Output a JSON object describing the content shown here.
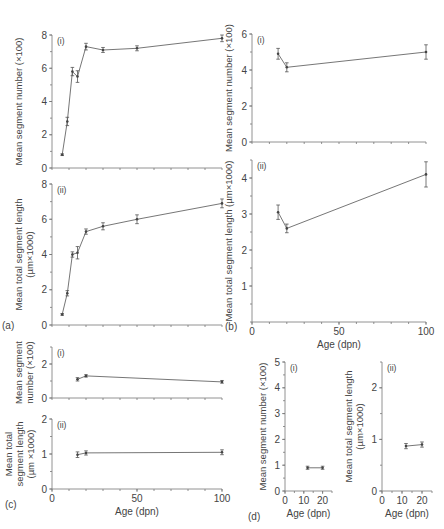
{
  "figure": {
    "panel_labels": [
      "(a)",
      "(b)",
      "(c)",
      "(d)"
    ]
  },
  "chart_data": [
    {
      "id": "a-i",
      "panel": "(a)",
      "subpanel": "(i)",
      "type": "line",
      "title": "",
      "xlabel": "",
      "ylabel": "Mean segment number (×100)",
      "xlim": [
        0,
        100
      ],
      "ylim": [
        0,
        8
      ],
      "yticks": [
        0,
        2,
        4,
        6,
        8
      ],
      "xticks_labeled": false,
      "grid": false,
      "x": [
        6,
        9,
        12,
        15,
        20,
        30,
        50,
        100
      ],
      "values": [
        0.8,
        2.8,
        5.8,
        5.5,
        7.3,
        7.1,
        7.2,
        7.8
      ],
      "errors": [
        0.05,
        0.25,
        0.25,
        0.35,
        0.2,
        0.15,
        0.15,
        0.2
      ]
    },
    {
      "id": "a-ii",
      "panel": "(a)",
      "subpanel": "(ii)",
      "type": "line",
      "title": "",
      "xlabel": "",
      "ylabel": "Mean total segment length (µm×1000)",
      "xlim": [
        0,
        100
      ],
      "ylim": [
        0,
        8
      ],
      "yticks": [
        0,
        2,
        4,
        6,
        8
      ],
      "xticks_labeled": false,
      "grid": false,
      "x": [
        6,
        9,
        12,
        15,
        20,
        30,
        50,
        100
      ],
      "values": [
        0.6,
        1.8,
        4.0,
        4.1,
        5.3,
        5.6,
        6.0,
        6.9
      ],
      "errors": [
        0.05,
        0.15,
        0.15,
        0.35,
        0.15,
        0.2,
        0.25,
        0.25
      ]
    },
    {
      "id": "b-i",
      "panel": "(b)",
      "subpanel": "(i)",
      "type": "line",
      "title": "",
      "xlabel": "",
      "ylabel": "Mean segment number (×100)",
      "xlim": [
        0,
        100
      ],
      "ylim": [
        0,
        6
      ],
      "yticks": [
        0,
        2,
        4,
        6
      ],
      "xticks_labeled": false,
      "grid": false,
      "x": [
        15,
        20,
        100
      ],
      "values": [
        4.9,
        4.15,
        5.0
      ],
      "errors": [
        0.3,
        0.25,
        0.4
      ]
    },
    {
      "id": "b-ii",
      "panel": "(b)",
      "subpanel": "(ii)",
      "type": "line",
      "title": "",
      "xlabel": "Age (dpn)",
      "ylabel": "Mean total segment length (µm×1000)",
      "xlim": [
        0,
        100
      ],
      "ylim": [
        0,
        4.5
      ],
      "yticks": [
        1,
        2,
        3,
        4
      ],
      "xticks": [
        0,
        50,
        100
      ],
      "grid": false,
      "x": [
        15,
        20,
        100
      ],
      "values": [
        3.05,
        2.6,
        4.1
      ],
      "errors": [
        0.2,
        0.12,
        0.35
      ]
    },
    {
      "id": "c-i",
      "panel": "(c)",
      "subpanel": "(i)",
      "type": "line",
      "title": "",
      "xlabel": "",
      "ylabel": "Mean segment number (×100)",
      "xlim": [
        0,
        100
      ],
      "ylim": [
        0,
        3
      ],
      "yticks": [
        0,
        2
      ],
      "xticks_labeled": false,
      "grid": false,
      "x": [
        15,
        20,
        100
      ],
      "values": [
        1.1,
        1.3,
        0.95
      ],
      "errors": [
        0.1,
        0.07,
        0.08
      ]
    },
    {
      "id": "c-ii",
      "panel": "(c)",
      "subpanel": "(ii)",
      "type": "line",
      "title": "",
      "xlabel": "Age (dpn)",
      "ylabel": "Mean total segment length (µm ×1000)",
      "xlim": [
        0,
        100
      ],
      "ylim": [
        0,
        2
      ],
      "yticks": [
        0,
        1,
        2
      ],
      "xticks": [
        0,
        50,
        100
      ],
      "grid": false,
      "x": [
        15,
        20,
        100
      ],
      "values": [
        0.98,
        1.03,
        1.05
      ],
      "errors": [
        0.08,
        0.06,
        0.07
      ]
    },
    {
      "id": "d-i",
      "panel": "(d)",
      "subpanel": "(i)",
      "type": "line",
      "title": "",
      "xlabel": "Age (dpn)",
      "ylabel": "Mean segment number (×100)",
      "xlim": [
        0,
        25
      ],
      "ylim": [
        0,
        5
      ],
      "yticks": [
        0,
        1,
        2,
        3,
        4,
        5
      ],
      "xticks": [
        0,
        10,
        20
      ],
      "grid": false,
      "x": [
        12,
        20
      ],
      "values": [
        0.9,
        0.9
      ],
      "errors": [
        0.06,
        0.06
      ]
    },
    {
      "id": "d-ii",
      "panel": "(d)",
      "subpanel": "(ii)",
      "type": "line",
      "title": "",
      "xlabel": "Age (dpn)",
      "ylabel": "Mean total segment length (µm×1000)",
      "xlim": [
        0,
        25
      ],
      "ylim": [
        0,
        2.5
      ],
      "yticks": [
        0,
        1,
        2
      ],
      "xticks": [
        0,
        10,
        20
      ],
      "grid": false,
      "x": [
        12,
        20
      ],
      "values": [
        0.87,
        0.9
      ],
      "errors": [
        0.05,
        0.05
      ]
    }
  ],
  "layout": [
    {
      "id": "a-i",
      "x0": 52,
      "x1": 222,
      "y0": 35,
      "y1": 168,
      "ylabel_lines": [
        "Mean segment number (×100)"
      ],
      "ylabel_x": 22
    },
    {
      "id": "a-ii",
      "x0": 52,
      "x1": 222,
      "y0": 184,
      "y1": 325,
      "ylabel_lines": [
        "Mean total segment length",
        "(µm×1000)"
      ],
      "ylabel_x": 22
    },
    {
      "id": "b-i",
      "x0": 252,
      "x1": 426,
      "y0": 34,
      "y1": 142,
      "ylabel_lines": [
        "Mean segment number (×100)"
      ],
      "ylabel_x": 232
    },
    {
      "id": "b-ii",
      "x0": 252,
      "x1": 426,
      "y0": 160,
      "y1": 322,
      "ylabel_lines": [
        "Mean total segment length (µm×1000)"
      ],
      "ylabel_x": 232
    },
    {
      "id": "c-i",
      "x0": 52,
      "x1": 222,
      "y0": 347,
      "y1": 398,
      "ylabel_lines": [
        "Mean segment",
        "number (×100)"
      ],
      "ylabel_x": 22
    },
    {
      "id": "c-ii",
      "x0": 52,
      "x1": 222,
      "y0": 419,
      "y1": 489,
      "ylabel_lines": [
        "Mean total",
        "segment length",
        "(µm ×1000)"
      ],
      "ylabel_x": 12
    },
    {
      "id": "d-i",
      "x0": 285,
      "x1": 332,
      "y0": 362,
      "y1": 491,
      "ylabel_lines": [
        "Mean segment number (×100)"
      ],
      "ylabel_x": 266
    },
    {
      "id": "d-ii",
      "x0": 382,
      "x1": 432,
      "y0": 362,
      "y1": 491,
      "ylabel_lines": [
        "Mean total segment length",
        "(µm×1000)"
      ],
      "ylabel_x": 352
    }
  ],
  "panel_label_positions": [
    {
      "label": "(a)",
      "x": 2,
      "y": 329
    },
    {
      "label": "(b)",
      "x": 225,
      "y": 330
    },
    {
      "label": "(c)",
      "x": 5,
      "y": 508
    },
    {
      "label": "(d)",
      "x": 248,
      "y": 520
    }
  ],
  "colors": {
    "line": "#666666",
    "axis": "#777777",
    "text": "#444444"
  }
}
